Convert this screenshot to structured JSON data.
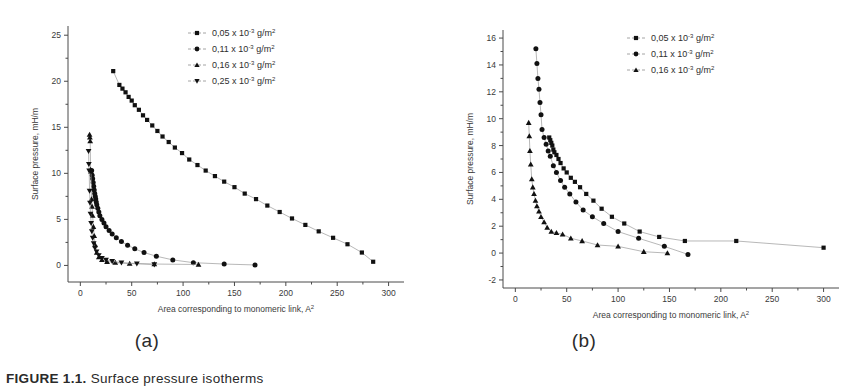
{
  "figure": {
    "caption_prefix": "FIGURE 1.1.",
    "caption_rest": "  Surface pressure isotherms",
    "panels": [
      {
        "id": "a",
        "label": "(a)"
      },
      {
        "id": "b",
        "label": "(b)"
      }
    ]
  },
  "chart_data": [
    {
      "type": "scatter",
      "panel": "a",
      "title": "",
      "xlabel": "Area corresponding to monomeric link, A",
      "xlabel_sup": "2",
      "ylabel": "Surface pressure, mH/m",
      "xlim": [
        -12,
        315
      ],
      "ylim": [
        -1.8,
        26
      ],
      "xticks": [
        0,
        50,
        100,
        150,
        200,
        250,
        300
      ],
      "yticks": [
        0,
        5,
        10,
        15,
        20,
        25
      ],
      "minor_x_per_interval": 1,
      "minor_y_per_interval": 1,
      "grid": false,
      "legend_position": "top-right",
      "series": [
        {
          "name": "0,05 x 10",
          "exponent": "-3",
          "unit": "g/m",
          "unit_sup": "2",
          "marker": "square",
          "x": [
            32,
            38,
            41,
            44,
            47,
            50,
            53,
            57,
            61,
            65,
            70,
            75,
            80,
            86,
            92,
            99,
            106,
            114,
            122,
            131,
            140,
            150,
            160,
            171,
            182,
            194,
            206,
            219,
            232,
            246,
            260,
            274,
            285
          ],
          "y": [
            21.1,
            19.6,
            19.2,
            18.8,
            18.3,
            17.9,
            17.4,
            16.9,
            16.3,
            15.8,
            15.2,
            14.6,
            14.0,
            13.4,
            12.8,
            12.2,
            11.5,
            10.9,
            10.3,
            9.7,
            9.1,
            8.5,
            7.8,
            7.2,
            6.5,
            5.8,
            5.1,
            4.4,
            3.7,
            3.0,
            2.3,
            1.4,
            0.4
          ]
        },
        {
          "name": "0,11 x 10",
          "exponent": "-3",
          "unit": "g/m",
          "unit_sup": "2",
          "marker": "circle",
          "x": [
            11,
            11.5,
            12,
            12.5,
            13,
            13.5,
            14,
            14.5,
            15,
            15.5,
            16,
            17,
            18,
            19,
            21,
            23,
            25,
            28,
            31,
            35,
            40,
            46,
            53,
            62,
            74,
            90,
            110,
            140,
            170
          ],
          "y": [
            10.3,
            9.8,
            9.4,
            9.0,
            8.6,
            8.2,
            7.8,
            7.5,
            7.2,
            6.9,
            6.6,
            6.2,
            5.8,
            5.4,
            5.0,
            4.6,
            4.2,
            3.8,
            3.4,
            3.0,
            2.6,
            2.2,
            1.8,
            1.4,
            1.0,
            0.6,
            0.3,
            0.15,
            0.05
          ]
        },
        {
          "name": "0,16 x 10",
          "exponent": "-3",
          "unit": "g/m",
          "unit_sup": "2",
          "marker": "triangle-up",
          "x": [
            9,
            9.3,
            9.6,
            10,
            10.4,
            10.9,
            11.4,
            12,
            12.7,
            13.5,
            14.5,
            16,
            18,
            21,
            26,
            34,
            48,
            72,
            115
          ],
          "y": [
            14.2,
            13.9,
            13.5,
            10.4,
            10.2,
            7.2,
            6.4,
            5.4,
            4.2,
            3.2,
            2.2,
            1.4,
            0.9,
            0.6,
            0.4,
            0.3,
            0.2,
            0.15,
            0.1
          ]
        },
        {
          "name": "0,25 x 10",
          "exponent": "-3",
          "unit": "g/m",
          "unit_sup": "2",
          "marker": "triangle-down",
          "x": [
            8,
            8.3,
            8.6,
            9,
            9.4,
            9.9,
            10.5,
            11.2,
            12,
            13,
            14.2,
            15.8,
            18,
            21,
            25,
            31,
            40,
            55,
            72
          ],
          "y": [
            12.4,
            11.0,
            10.3,
            8.1,
            6.8,
            5.6,
            4.6,
            3.7,
            3.0,
            2.4,
            1.9,
            1.5,
            1.1,
            0.8,
            0.6,
            0.45,
            0.3,
            0.2,
            0.1
          ]
        }
      ]
    },
    {
      "type": "scatter",
      "panel": "b",
      "title": "",
      "xlabel": "Area corresponding to monomeric link, A",
      "xlabel_sup": "2",
      "ylabel": "Surface pressure, mH/m",
      "xlim": [
        -12,
        315
      ],
      "ylim": [
        -2.6,
        16.6
      ],
      "xticks": [
        0,
        50,
        100,
        150,
        200,
        250,
        300
      ],
      "yticks": [
        -2,
        0,
        2,
        4,
        6,
        8,
        10,
        12,
        14,
        16
      ],
      "minor_x_per_interval": 1,
      "minor_y_per_interval": 1,
      "grid": false,
      "legend_position": "top-right",
      "series": [
        {
          "name": "0,05 x 10",
          "exponent": "-3",
          "unit": "g/m",
          "unit_sup": "2",
          "marker": "square",
          "x": [
            33,
            34,
            35,
            36,
            37,
            38,
            40,
            42,
            44,
            47,
            50,
            54,
            58,
            63,
            69,
            76,
            84,
            94,
            106,
            121,
            140,
            165,
            215,
            300
          ],
          "y": [
            8.6,
            8.4,
            8.2,
            8.0,
            7.7,
            7.5,
            7.3,
            7.0,
            6.7,
            6.3,
            6.0,
            5.6,
            5.3,
            4.9,
            4.4,
            3.9,
            3.3,
            2.7,
            2.2,
            1.6,
            1.2,
            0.9,
            0.9,
            0.4
          ]
        },
        {
          "name": "0,11 x 10",
          "exponent": "-3",
          "unit": "g/m",
          "unit_sup": "2",
          "marker": "circle",
          "x": [
            20,
            21,
            22,
            23,
            24,
            25,
            26,
            28,
            30,
            32,
            34,
            37,
            40,
            44,
            48,
            53,
            59,
            66,
            75,
            86,
            100,
            120,
            145,
            168
          ],
          "y": [
            15.2,
            14.1,
            13.0,
            12.2,
            11.2,
            10.3,
            9.2,
            8.6,
            8.1,
            7.6,
            7.2,
            6.5,
            6.0,
            5.4,
            4.9,
            4.4,
            3.8,
            3.2,
            2.7,
            2.2,
            1.6,
            1.1,
            0.5,
            -0.1
          ]
        },
        {
          "name": "0,16 x 10",
          "exponent": "-3",
          "unit": "g/m",
          "unit_sup": "2",
          "marker": "triangle-up",
          "x": [
            13,
            13.6,
            14.2,
            15,
            16,
            17,
            18.2,
            19.6,
            21,
            23,
            25,
            28,
            31,
            35,
            40,
            46,
            54,
            65,
            80,
            100,
            125,
            148
          ],
          "y": [
            9.7,
            8.7,
            7.6,
            6.6,
            5.5,
            4.9,
            4.4,
            3.9,
            3.5,
            3.1,
            2.7,
            2.3,
            1.9,
            1.6,
            1.5,
            1.4,
            1.1,
            0.9,
            0.6,
            0.5,
            0.1,
            0.0
          ]
        }
      ]
    }
  ]
}
